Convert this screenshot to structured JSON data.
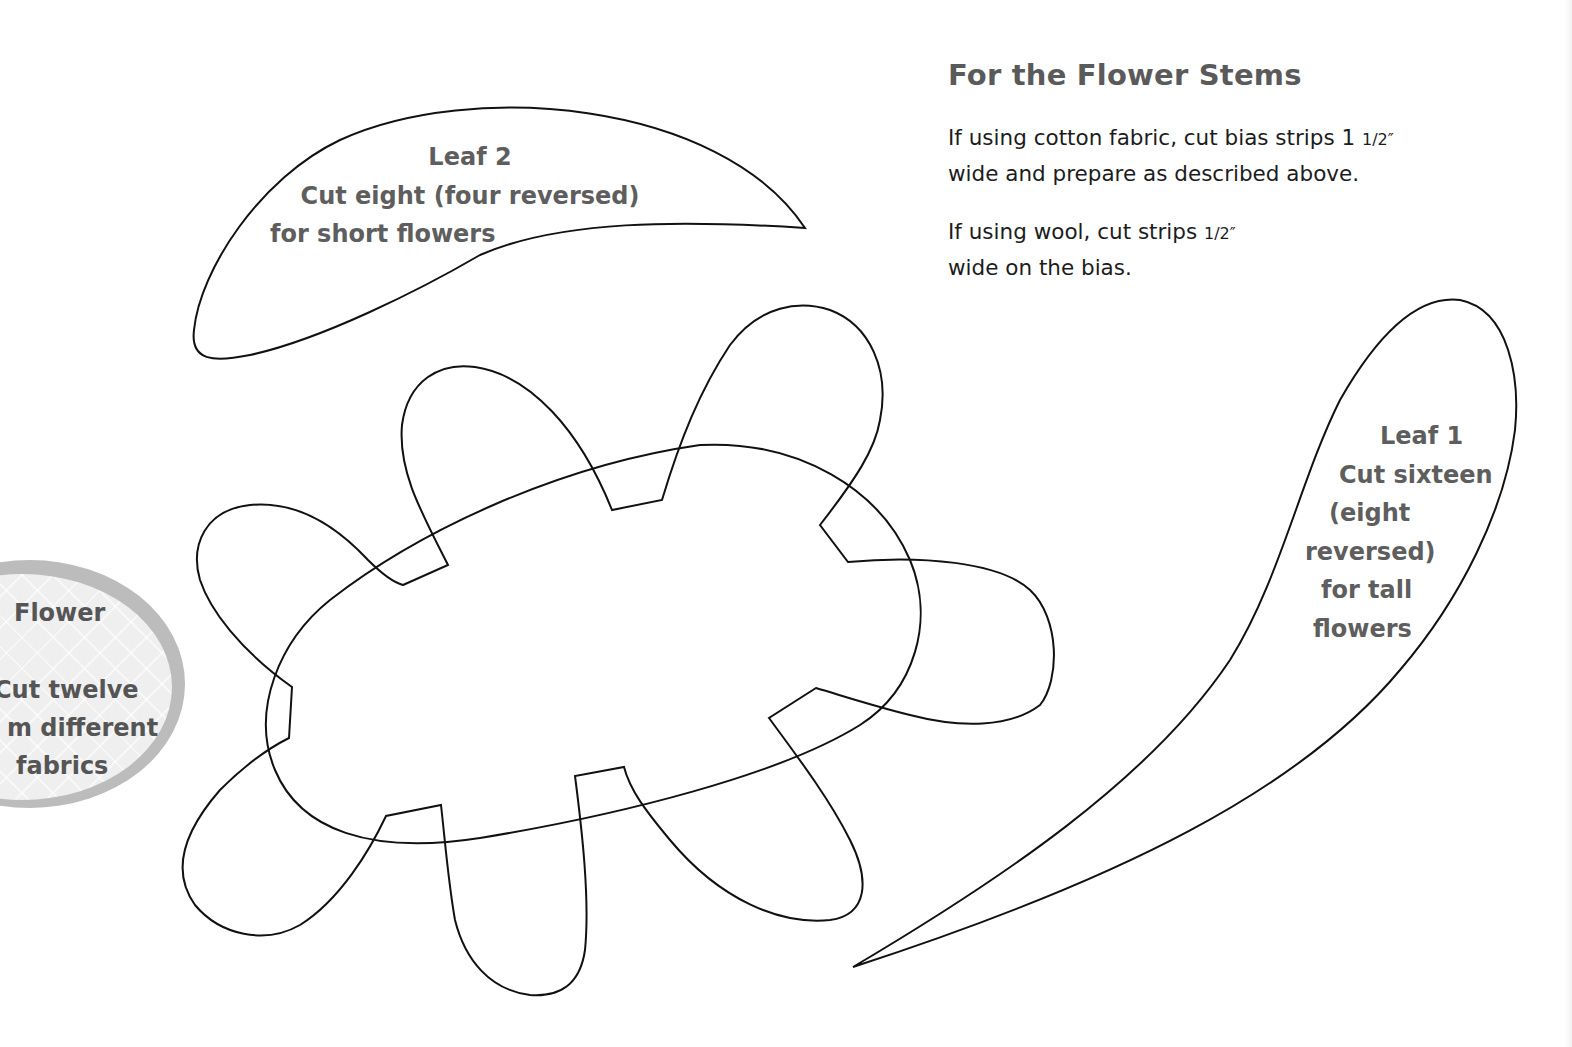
{
  "stems_section": {
    "title": "For the Flower Stems",
    "cotton_instruction": {
      "line1": "If using cotton fabric, cut bias strips 1 ",
      "line1_fraction": "1/2″",
      "line2": "wide and prepare as described above."
    },
    "wool_instruction": {
      "line1": "If using wool, cut strips ",
      "line1_fraction": "1/2″",
      "line2": "wide on the bias."
    }
  },
  "templates": {
    "leaf2": {
      "name": "Leaf 2",
      "instruction_line1": "Cut eight (four reversed)",
      "instruction_line2": "for short flowers"
    },
    "leaf1": {
      "name": "Leaf 1",
      "instruction_lines": [
        "Cut sixteen",
        "(eight",
        "reversed)",
        "for tall",
        "flowers"
      ]
    },
    "flower": {
      "name": "Flower",
      "instruction_lines": [
        "Cut twelve",
        "m different",
        "fabrics"
      ]
    }
  },
  "colors": {
    "outline": "#111111",
    "label_text": "#5e5e5e",
    "body_text": "#1c1c1c",
    "tag_ring": "#bcbcbc",
    "tag_fill": "#efefef"
  }
}
